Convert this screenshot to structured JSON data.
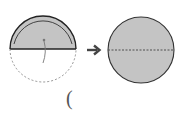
{
  "diagram": {
    "left_figure": {
      "shape": "semicircle-with-dashed-lower-half",
      "fill_color": "#c4c4c4",
      "stroke_color": "#333333",
      "fold_indicator": "curved-arrow-from-center"
    },
    "arrow": {
      "icon": "right-arrow-icon",
      "color": "#444444"
    },
    "right_figure": {
      "shape": "full-circle-with-dashed-diameter",
      "fill_color": "#c4c4c4",
      "stroke_color": "#333333"
    },
    "answer_blank": {
      "text": "("
    }
  }
}
